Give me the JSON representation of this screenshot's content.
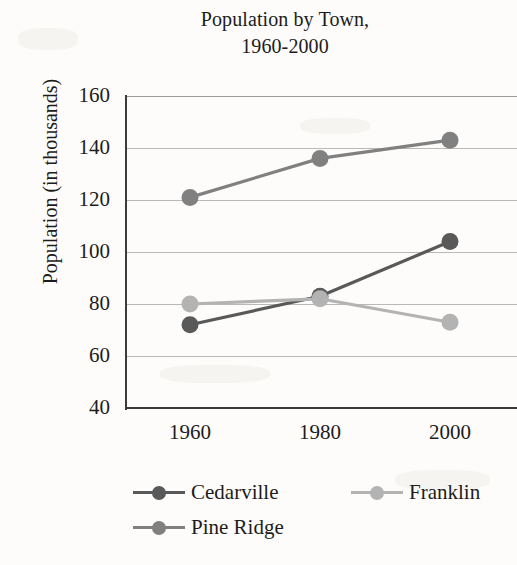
{
  "chart_data": {
    "type": "line",
    "title": "Population by Town, 1960-2000",
    "title_lines": [
      "Population by Town,",
      "1960-2000"
    ],
    "xlabel": "",
    "ylabel": "Population (in thousands)",
    "categories": [
      "1960",
      "1980",
      "2000"
    ],
    "x": [
      1960,
      1980,
      2000
    ],
    "ylim": [
      40,
      160
    ],
    "y_ticks": [
      160,
      140,
      120,
      100,
      80,
      60,
      40
    ],
    "grid": true,
    "legend_position": "bottom",
    "series": [
      {
        "name": "Cedarville",
        "values": [
          72,
          83,
          104
        ],
        "color": "#595959"
      },
      {
        "name": "Franklin",
        "values": [
          80,
          82,
          73
        ],
        "color": "#b3b3b3"
      },
      {
        "name": "Pine Ridge",
        "values": [
          121,
          136,
          143
        ],
        "color": "#808080"
      }
    ]
  },
  "legend": {
    "items": [
      {
        "label": "Cedarville",
        "color": "#595959",
        "marker": "circle-marker"
      },
      {
        "label": "Franklin",
        "color": "#b3b3b3",
        "marker": "circle-marker"
      },
      {
        "label": "Pine Ridge",
        "color": "#808080",
        "marker": "circle-marker"
      }
    ]
  },
  "axes": {
    "y_tick_labels": [
      "160",
      "140",
      "120",
      "100",
      "80",
      "60",
      "40"
    ],
    "x_tick_labels": [
      "1960",
      "1980",
      "2000"
    ]
  }
}
